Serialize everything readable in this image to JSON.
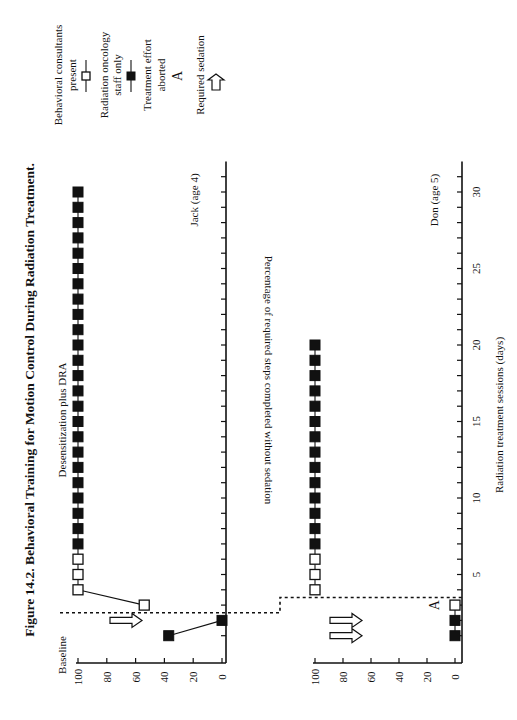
{
  "figure": {
    "title": "Figure 14.2. Behavioral Training for Motion Control During Radiation Treatment.",
    "ylabel": "Percentage of required steps completed without sedation",
    "xlabel": "Radiation treatment sessions (days)",
    "phase_labels": {
      "baseline": "Baseline",
      "treatment": "Desensitization plus DRA"
    },
    "panels": [
      {
        "label": "Jack (age 4)"
      },
      {
        "label": "Don (age 5)"
      }
    ],
    "yticks": [
      "0",
      "20",
      "40",
      "60",
      "80",
      "100"
    ],
    "xticks": [
      "5",
      "10",
      "15",
      "20",
      "25",
      "30"
    ],
    "legend": [
      {
        "label": "Behavioral consultants present",
        "line1": "Behavioral consultants",
        "line2": "present",
        "marker": "open-square"
      },
      {
        "label": "Radiation oncology staff only",
        "line1": "Radiation oncology",
        "line2": "staff only",
        "marker": "filled-square"
      },
      {
        "label": "Treatment effort aborted",
        "line1": "Treatment effort",
        "line2": "aborted",
        "marker": "A"
      },
      {
        "label": "Required sedation",
        "line1": "Required sedation",
        "line2": "",
        "marker": "arrow"
      }
    ]
  },
  "chart_data": [
    {
      "type": "line",
      "title": "Jack (age 4)",
      "xlabel": "Radiation treatment sessions (days)",
      "ylabel": "Percentage of required steps completed without sedation",
      "ylim": [
        0,
        100
      ],
      "xlim": [
        0,
        32
      ],
      "phase_change_after_session": 2.5,
      "phases": [
        "Baseline",
        "Desensitization plus DRA"
      ],
      "series": [
        {
          "name": "Radiation oncology staff only",
          "marker": "filled-square",
          "points": [
            [
              1,
              37
            ],
            [
              2,
              0
            ],
            [
              7,
              100
            ],
            [
              8,
              100
            ],
            [
              9,
              100
            ],
            [
              10,
              100
            ],
            [
              11,
              100
            ],
            [
              12,
              100
            ],
            [
              13,
              100
            ],
            [
              14,
              100
            ],
            [
              15,
              100
            ],
            [
              16,
              100
            ],
            [
              17,
              100
            ],
            [
              18,
              100
            ],
            [
              19,
              100
            ],
            [
              20,
              100
            ],
            [
              21,
              100
            ],
            [
              22,
              100
            ],
            [
              23,
              100
            ],
            [
              24,
              100
            ],
            [
              25,
              100
            ],
            [
              26,
              100
            ],
            [
              27,
              100
            ],
            [
              28,
              100
            ],
            [
              29,
              100
            ],
            [
              30,
              100
            ]
          ]
        },
        {
          "name": "Behavioral consultants present",
          "marker": "open-square",
          "points": [
            [
              3,
              54
            ],
            [
              4,
              100
            ],
            [
              5,
              100
            ],
            [
              6,
              100
            ]
          ]
        }
      ],
      "annotations": [
        {
          "type": "required-sedation-arrow",
          "session": 2
        }
      ]
    },
    {
      "type": "line",
      "title": "Don (age 5)",
      "xlabel": "Radiation treatment sessions (days)",
      "ylabel": "Percentage of required steps completed without sedation",
      "ylim": [
        0,
        100
      ],
      "xlim": [
        0,
        32
      ],
      "phase_change_after_session": 3.5,
      "phases": [
        "Baseline",
        "Desensitization plus DRA"
      ],
      "series": [
        {
          "name": "Radiation oncology staff only",
          "marker": "filled-square",
          "points": [
            [
              1,
              0
            ],
            [
              2,
              0
            ],
            [
              7,
              100
            ],
            [
              8,
              100
            ],
            [
              9,
              100
            ],
            [
              10,
              100
            ],
            [
              11,
              100
            ],
            [
              12,
              100
            ],
            [
              13,
              100
            ],
            [
              14,
              100
            ],
            [
              15,
              100
            ],
            [
              16,
              100
            ],
            [
              17,
              100
            ],
            [
              18,
              100
            ],
            [
              19,
              100
            ],
            [
              20,
              100
            ]
          ]
        },
        {
          "name": "Behavioral consultants present",
          "marker": "open-square",
          "points": [
            [
              3,
              0
            ],
            [
              4,
              100
            ],
            [
              5,
              100
            ],
            [
              6,
              100
            ]
          ]
        }
      ],
      "annotations": [
        {
          "type": "required-sedation-arrow",
          "session": 1
        },
        {
          "type": "required-sedation-arrow",
          "session": 2
        },
        {
          "type": "treatment-aborted-A",
          "session": 3
        }
      ]
    }
  ]
}
